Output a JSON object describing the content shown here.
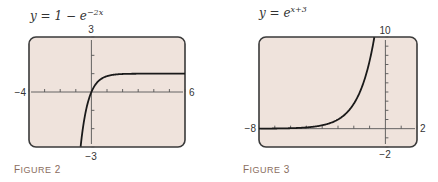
{
  "chart_data": [
    {
      "type": "line",
      "title": "y = 1 − e^(−2x)",
      "equation": {
        "base": "y = 1 − e",
        "exponent": "−2x"
      },
      "caption": "Figure 2",
      "xlabel": "",
      "ylabel": "",
      "xlim": [
        -4,
        6
      ],
      "ylim": [
        -3,
        3
      ],
      "window_labels": {
        "xmin": "−4",
        "xmax": "6",
        "ymin": "−3",
        "ymax": "3"
      },
      "x_tick_step": 1,
      "y_tick_step": 1,
      "grid": false,
      "series": [
        {
          "name": "y = 1 − e^(−2x)",
          "x": [
            -0.69,
            -0.5,
            -0.25,
            0,
            0.25,
            0.5,
            1,
            1.5,
            2,
            3,
            4,
            5,
            6
          ],
          "y": [
            -3.0,
            -1.72,
            -0.65,
            0,
            0.39,
            0.63,
            0.86,
            0.95,
            0.98,
            1.0,
            1.0,
            1.0,
            1.0
          ]
        }
      ]
    },
    {
      "type": "line",
      "title": "y = e^(x+3)",
      "equation": {
        "base": "y = e",
        "exponent": "x+3"
      },
      "caption": "Figure 3",
      "xlabel": "",
      "ylabel": "",
      "xlim": [
        -8,
        2
      ],
      "ylim": [
        -2,
        10
      ],
      "window_labels": {
        "xmin": "−8",
        "xmax": "2",
        "ymin": "−2",
        "ymax": "10"
      },
      "x_tick_step": 1,
      "y_tick_step": 1,
      "grid": false,
      "series": [
        {
          "name": "y = e^(x+3)",
          "x": [
            -8,
            -7,
            -6,
            -5,
            -4,
            -3,
            -2.5,
            -2,
            -1.5,
            -1,
            -0.7
          ],
          "y": [
            0.007,
            0.018,
            0.05,
            0.14,
            0.37,
            1.0,
            1.65,
            2.72,
            4.48,
            7.39,
            9.97
          ]
        }
      ]
    }
  ]
}
